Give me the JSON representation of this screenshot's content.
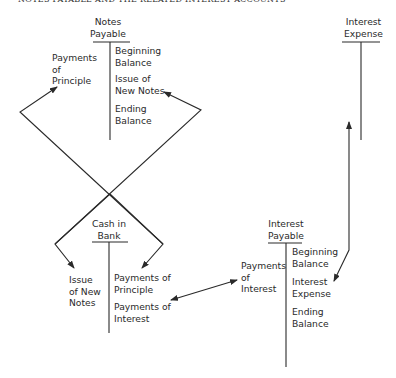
{
  "title": "NOTES PAYABLE AND THE RELATED INTEREST ACCOUNTS",
  "accounts": {
    "notes_payable": {
      "name": "Notes\nPayable",
      "debits": [
        "Payments\nof\nPrinciple"
      ],
      "credits": [
        "Beginning\nBalance",
        "Issue of\nNew Notes",
        "Ending\nBalance"
      ]
    },
    "interest_expense": {
      "name": "Interest\nExpense",
      "debits": [],
      "credits": []
    },
    "cash_in_bank": {
      "name": "Cash in\nBank",
      "debits": [
        "Issue\nof New\nNotes"
      ],
      "credits": [
        "Payments of\nPrinciple",
        "Payments of\nInterest"
      ]
    },
    "interest_payable": {
      "name": "Interest\nPayable",
      "debits": [
        "Payments\nof\nInterest"
      ],
      "credits": [
        "Beginning\nBalance",
        "Interest\nExpense",
        "Ending\nBalance"
      ]
    }
  },
  "flows": [
    {
      "from": "Cash in Bank: Issue of New Notes",
      "to": "Notes Payable: Issue of New Notes"
    },
    {
      "from": "Cash in Bank: Payments of Principle",
      "to": "Notes Payable: Payments of Principle"
    },
    {
      "from": "Notes Payable: Issue of New Notes",
      "to": "Cash in Bank: Issue of New Notes"
    },
    {
      "from": "Notes Payable: Payments of Principle",
      "to": "Cash in Bank: Payments of Principle"
    },
    {
      "from": "Cash in Bank: Payments of Interest",
      "to": "Interest Payable: Payments of Interest",
      "bidirectional": true
    },
    {
      "from": "Interest Expense",
      "to": "Interest Payable: Interest Expense",
      "bidirectional": true
    }
  ],
  "colors": {
    "ink": "#2a2a2a",
    "background": "#ffffff"
  }
}
